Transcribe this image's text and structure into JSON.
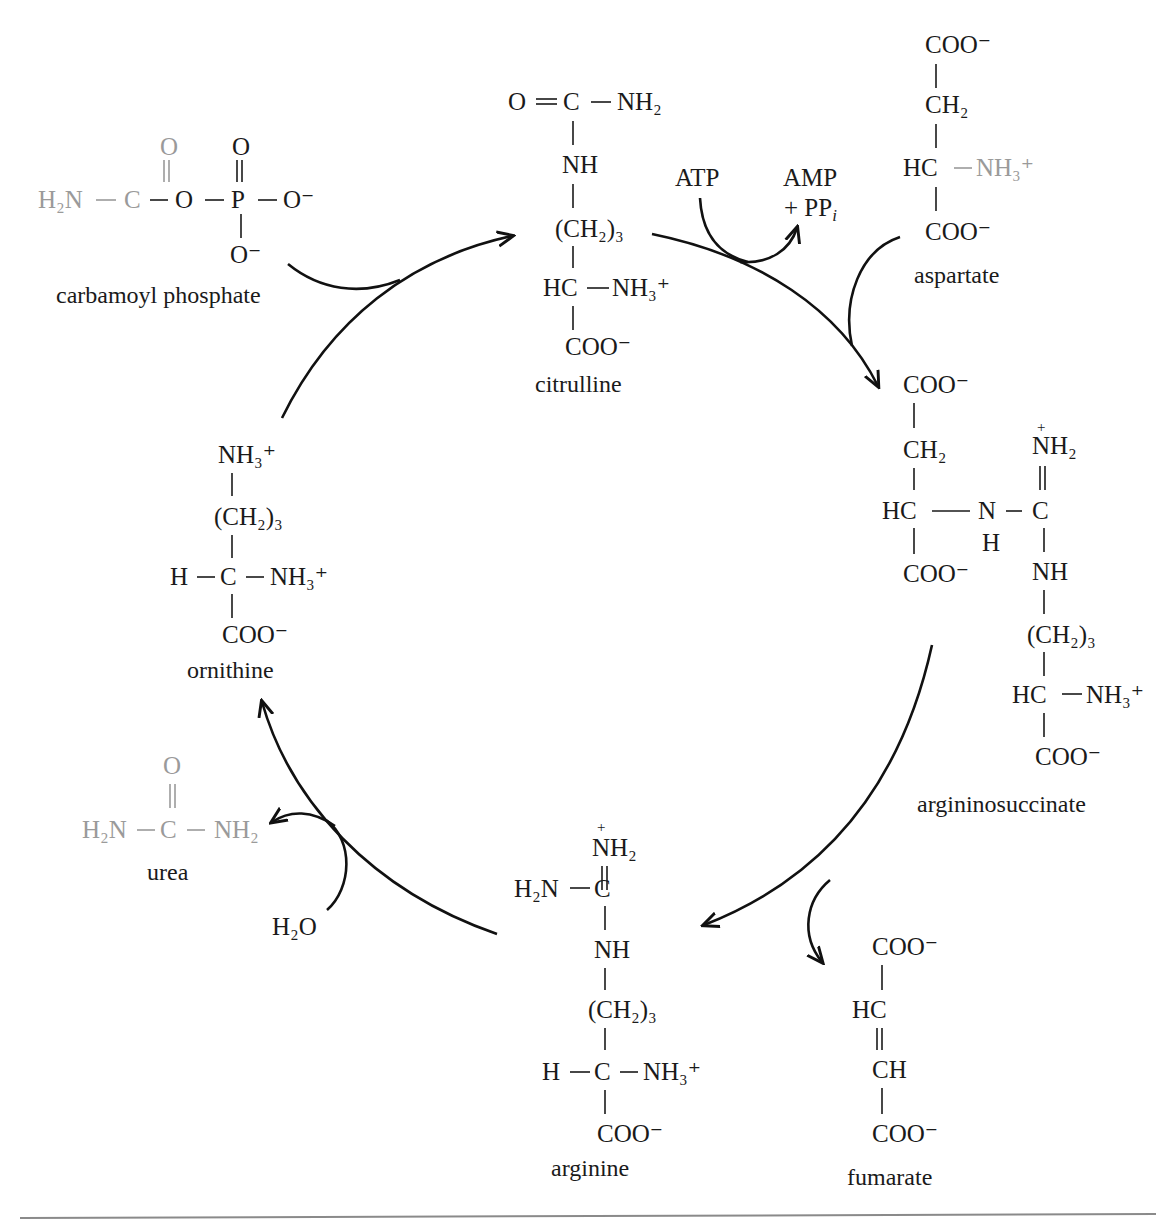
{
  "figure": {
    "cycle_order": [
      "ornithine",
      "citrulline",
      "argininosuccinate",
      "arginine",
      "ornithine"
    ]
  },
  "colors": {
    "ink": "#1a1a1a",
    "reactant_grey": "#9a9a9a",
    "rule": "#8a8a8a"
  },
  "molecules": {
    "carbamoyl_phosphate": {
      "name": "carbamoyl phosphate",
      "row_top": [
        "O",
        "O"
      ],
      "row_main": [
        "H₂N",
        "C",
        "O",
        "P",
        "O⁻"
      ],
      "row_bottom": "O⁻"
    },
    "citrulline": {
      "name": "citrulline",
      "rows": [
        "O",
        "C",
        "NH₂",
        "NH",
        "(CH₂)₃",
        "HC",
        "NH₃⁺",
        "COO⁻"
      ]
    },
    "aspartate": {
      "name": "aspartate",
      "rows": [
        "COO⁻",
        "CH₂",
        "HC",
        "NH₃⁺",
        "COO⁻"
      ]
    },
    "argininosuccinate": {
      "name": "argininosuccinate",
      "rows": [
        "COO⁻",
        "CH₂",
        "HC",
        "N",
        "H",
        "C",
        "NH₂",
        "+",
        "COO⁻",
        "NH",
        "(CH₂)₃",
        "HC",
        "NH₃⁺",
        "COO⁻"
      ]
    },
    "fumarate": {
      "name": "fumarate",
      "rows": [
        "COO⁻",
        "HC",
        "CH",
        "COO⁻"
      ]
    },
    "arginine": {
      "name": "arginine",
      "rows": [
        "+",
        "NH₂",
        "H₂N",
        "C",
        "NH",
        "(CH₂)₃",
        "H",
        "C",
        "NH₃⁺",
        "COO⁻"
      ]
    },
    "ornithine": {
      "name": "ornithine",
      "rows": [
        "NH₃⁺",
        "(CH₂)₃",
        "H",
        "C",
        "NH₃⁺",
        "COO⁻"
      ]
    },
    "urea": {
      "name": "urea",
      "rows": [
        "O",
        "H₂N",
        "C",
        "NH₂"
      ]
    }
  },
  "cofactors": {
    "atp": "ATP",
    "amp": "AMP",
    "ppi_prefix": "+ PP",
    "ppi_sub": "i",
    "water": "H₂O"
  }
}
